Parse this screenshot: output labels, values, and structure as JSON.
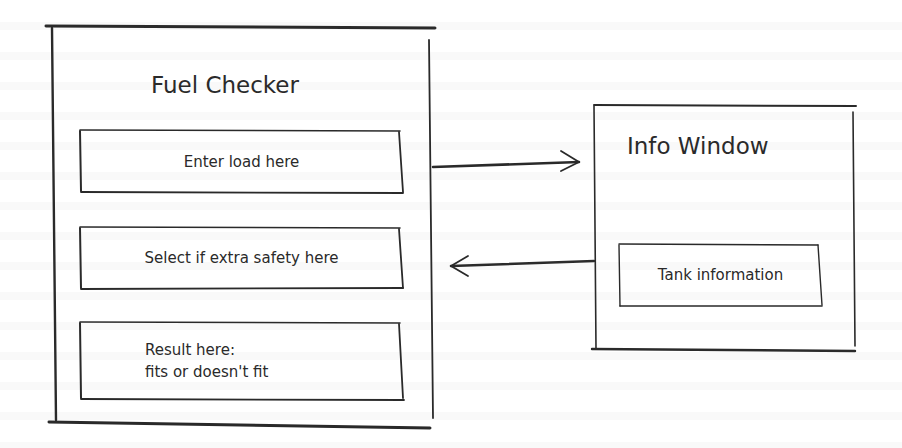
{
  "fuel_checker": {
    "title": "Fuel Checker",
    "load_field": {
      "label": "Enter load here"
    },
    "safety_field": {
      "label": "Select if extra safety here"
    },
    "result_field": {
      "label": "Result here:\nfits or doesn't fit"
    }
  },
  "info_window": {
    "title": "Info Window",
    "tank_field": {
      "label": "Tank information"
    }
  },
  "connections": [
    {
      "from": "fuel_checker",
      "to": "info_window",
      "direction": "right"
    },
    {
      "from": "info_window",
      "to": "fuel_checker",
      "direction": "left"
    }
  ],
  "colors": {
    "stroke": "#2a2a2a",
    "background": "#ffffff"
  }
}
